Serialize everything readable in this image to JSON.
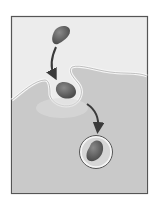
{
  "diagram": {
    "type": "process-illustration",
    "steps": [
      {
        "id": 1,
        "description": "particle outside the cell"
      },
      {
        "id": 2,
        "description": "cell membrane invaginates around particle"
      },
      {
        "id": 3,
        "description": "particle enclosed in vesicle inside the cell"
      }
    ],
    "labels": [],
    "colors": {
      "background": "#ffffff",
      "frame": "#555555",
      "extracellular": "#ececec",
      "cytoplasm": "#c9c9c9",
      "membrane": "#f4f4f4",
      "particle": "#6e6e6e",
      "arrow": "#3a3a3a"
    }
  }
}
